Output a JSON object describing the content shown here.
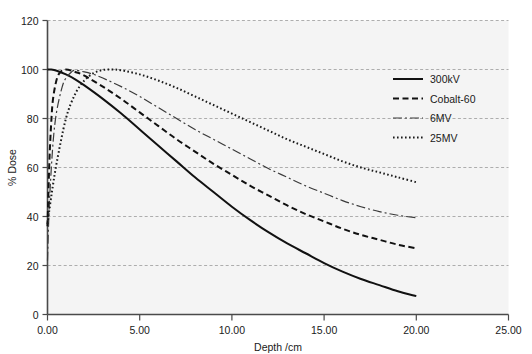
{
  "chart_data": {
    "type": "line",
    "title": "",
    "xlabel": "Depth /cm",
    "ylabel": "% Dose",
    "xlim": [
      0,
      25
    ],
    "ylim": [
      0,
      120
    ],
    "grid": true,
    "grid_axis": "y",
    "legend_position": "top-right",
    "xticks": [
      0,
      5,
      10,
      15,
      20,
      25
    ],
    "xtick_labels": [
      "0.00",
      "5.00",
      "10.00",
      "15.00",
      "20.00",
      "25.00"
    ],
    "yticks": [
      0,
      20,
      40,
      60,
      80,
      100,
      120
    ],
    "ytick_labels": [
      "0",
      "20",
      "40",
      "60",
      "80",
      "100",
      "120"
    ],
    "series": [
      {
        "name": "300kV",
        "style": "solid",
        "dasharray": "",
        "width": 2.0,
        "color": "#111111",
        "x": [
          0.0,
          0.2,
          0.5,
          1.0,
          1.5,
          2.0,
          3.0,
          4.0,
          5.0,
          6.0,
          7.0,
          8.0,
          9.0,
          10.0,
          11.0,
          12.0,
          13.0,
          14.0,
          15.0,
          16.0,
          17.0,
          18.0,
          19.0,
          20.0
        ],
        "y": [
          100.0,
          100.0,
          99.5,
          98.0,
          96.0,
          93.5,
          88.0,
          82.0,
          75.5,
          69.0,
          62.5,
          56.0,
          50.0,
          44.0,
          38.5,
          33.5,
          29.0,
          25.0,
          21.0,
          17.5,
          14.5,
          12.0,
          9.5,
          7.5
        ]
      },
      {
        "name": "Cobalt-60",
        "style": "dashed",
        "dasharray": "6,3.5",
        "width": 2.0,
        "color": "#111111",
        "x": [
          0.0,
          0.1,
          0.2,
          0.3,
          0.5,
          0.7,
          1.0,
          1.5,
          2.0,
          3.0,
          4.0,
          5.0,
          6.0,
          7.0,
          8.0,
          9.0,
          10.0,
          11.0,
          12.0,
          13.0,
          14.0,
          15.0,
          16.0,
          17.0,
          18.0,
          19.0,
          20.0
        ],
        "y": [
          36.0,
          62.0,
          78.0,
          88.0,
          96.0,
          99.0,
          100.0,
          99.0,
          97.5,
          93.0,
          88.0,
          82.5,
          77.0,
          71.5,
          66.5,
          61.5,
          57.0,
          52.5,
          48.5,
          44.5,
          41.0,
          38.0,
          35.0,
          32.5,
          30.5,
          28.5,
          27.0
        ]
      },
      {
        "name": "6MV",
        "style": "dashdot",
        "dasharray": "9,3,2,3",
        "width": 1.2,
        "color": "#3a3a3a",
        "x": [
          0.0,
          0.1,
          0.3,
          0.5,
          0.8,
          1.0,
          1.3,
          1.5,
          2.0,
          2.5,
          3.0,
          4.0,
          5.0,
          6.0,
          7.0,
          8.0,
          9.0,
          10.0,
          11.0,
          12.0,
          13.0,
          14.0,
          15.0,
          16.0,
          17.0,
          18.0,
          19.0,
          20.0
        ],
        "y": [
          22.0,
          45.0,
          70.0,
          83.0,
          93.0,
          96.5,
          99.0,
          99.7,
          99.0,
          98.0,
          96.5,
          93.0,
          89.0,
          84.5,
          80.0,
          75.5,
          71.5,
          67.5,
          63.5,
          59.5,
          56.0,
          52.5,
          49.5,
          46.5,
          44.0,
          42.0,
          40.5,
          39.5
        ]
      },
      {
        "name": "25MV",
        "style": "dotted",
        "dasharray": "1.6,2.4",
        "width": 2.0,
        "color": "#1a1a1a",
        "x": [
          0.0,
          0.2,
          0.5,
          1.0,
          1.5,
          2.0,
          2.5,
          3.0,
          3.5,
          4.0,
          5.0,
          6.0,
          7.0,
          8.0,
          9.0,
          10.0,
          11.0,
          12.0,
          13.0,
          14.0,
          15.0,
          16.0,
          17.0,
          18.0,
          19.0,
          20.0
        ],
        "y": [
          37.0,
          48.0,
          62.0,
          80.0,
          90.0,
          95.5,
          98.5,
          99.8,
          100.0,
          99.7,
          98.0,
          95.5,
          92.5,
          89.0,
          85.5,
          82.0,
          78.5,
          75.0,
          71.5,
          68.5,
          65.5,
          62.5,
          60.0,
          58.0,
          56.0,
          54.0
        ]
      }
    ]
  },
  "legend": {
    "entries": [
      {
        "label": "300kV"
      },
      {
        "label": "Cobalt-60"
      },
      {
        "label": "6MV"
      },
      {
        "label": "25MV"
      }
    ]
  },
  "colors": {
    "plot_background": "#f4f4f4",
    "grid": "#9a9a9a",
    "axis": "#4a4a4a",
    "text": "#1a1a1a"
  }
}
